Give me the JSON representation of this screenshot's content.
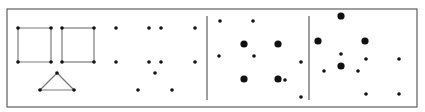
{
  "figure": {
    "width": 425,
    "height": 112,
    "background": "#ffffff",
    "frame": {
      "x": 7,
      "y": 9,
      "w": 410,
      "h": 98,
      "stroke": "#6b6b6b",
      "stroke_width": 1.3
    },
    "separators": [
      {
        "x": 207,
        "y1": 16,
        "y2": 100,
        "stroke": "#6b6b6b"
      },
      {
        "x": 309,
        "y1": 16,
        "y2": 100,
        "stroke": "#6b6b6b"
      }
    ],
    "line_color": "#7a7a7a",
    "dot_color": "#111111",
    "small_r": 1.8,
    "large_r": 3.6,
    "panels": [
      {
        "name": "connected-graphs",
        "edges": [
          [
            18,
            28,
            51,
            28
          ],
          [
            51,
            28,
            51,
            62
          ],
          [
            51,
            62,
            18,
            62
          ],
          [
            18,
            62,
            18,
            28
          ],
          [
            62,
            28,
            94,
            28
          ],
          [
            94,
            28,
            94,
            62
          ],
          [
            94,
            62,
            62,
            62
          ],
          [
            62,
            62,
            62,
            28
          ],
          [
            57,
            73,
            40,
            90
          ],
          [
            57,
            73,
            74,
            90
          ],
          [
            40,
            90,
            74,
            90
          ]
        ],
        "dots": [
          [
            18,
            28,
            "s"
          ],
          [
            51,
            28,
            "s"
          ],
          [
            18,
            62,
            "s"
          ],
          [
            51,
            62,
            "s"
          ],
          [
            62,
            28,
            "s"
          ],
          [
            94,
            28,
            "s"
          ],
          [
            62,
            62,
            "s"
          ],
          [
            94,
            62,
            "s"
          ],
          [
            57,
            73,
            "s"
          ],
          [
            40,
            90,
            "s"
          ],
          [
            74,
            90,
            "s"
          ]
        ]
      },
      {
        "name": "unconnected-dots",
        "edges": [],
        "dots": [
          [
            116,
            28,
            "s"
          ],
          [
            149,
            28,
            "s"
          ],
          [
            161,
            28,
            "s"
          ],
          [
            195,
            28,
            "s"
          ],
          [
            116,
            62,
            "s"
          ],
          [
            149,
            62,
            "s"
          ],
          [
            161,
            62,
            "s"
          ],
          [
            195,
            62,
            "s"
          ],
          [
            155,
            73,
            "s"
          ],
          [
            138,
            90,
            "s"
          ],
          [
            172,
            90,
            "s"
          ]
        ]
      },
      {
        "name": "mixed-size-dots-a",
        "edges": [],
        "dots": [
          [
            220,
            21,
            "s"
          ],
          [
            253,
            21,
            "s"
          ],
          [
            244,
            44,
            "l"
          ],
          [
            278,
            44,
            "l"
          ],
          [
            219,
            56,
            "s"
          ],
          [
            254,
            56,
            "s"
          ],
          [
            301,
            62,
            "s"
          ],
          [
            244,
            79,
            "l"
          ],
          [
            278,
            79,
            "l"
          ],
          [
            285,
            80,
            "s"
          ],
          [
            301,
            97,
            "s"
          ]
        ]
      },
      {
        "name": "mixed-size-dots-b",
        "edges": [],
        "dots": [
          [
            341,
            16,
            "l"
          ],
          [
            318,
            41,
            "l"
          ],
          [
            365,
            41,
            "l"
          ],
          [
            341,
            54,
            "s"
          ],
          [
            366,
            59,
            "s"
          ],
          [
            399,
            59,
            "s"
          ],
          [
            341,
            66,
            "l"
          ],
          [
            324,
            71,
            "s"
          ],
          [
            358,
            71,
            "s"
          ],
          [
            366,
            94,
            "s"
          ],
          [
            399,
            94,
            "s"
          ]
        ]
      }
    ]
  }
}
